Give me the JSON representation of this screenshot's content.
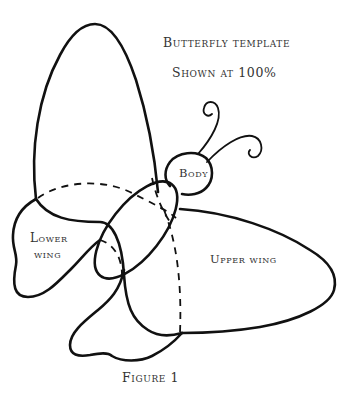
{
  "template": {
    "title": "Butterfly template",
    "subtitle": "Shown at 100%",
    "figure_caption": "Figure 1"
  },
  "parts": {
    "body": "Body",
    "lower_wing_line1": "Lower",
    "lower_wing_line2": "wing",
    "upper_wing": "Upper wing"
  },
  "colors": {
    "outline": "#111111",
    "text": "#333333",
    "background": "#ffffff"
  }
}
